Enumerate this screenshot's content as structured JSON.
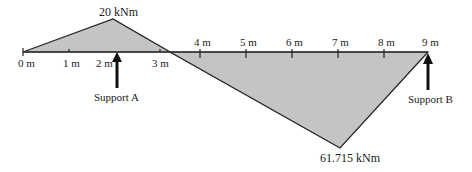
{
  "diagram": {
    "type": "bending_moment_diagram",
    "colors": {
      "fill": "#c4c4c4",
      "stroke": "#222222",
      "beam": "#333333",
      "arrow": "#111111"
    },
    "beam_ticks": [
      {
        "label": "0 m",
        "x": 23,
        "side": "below"
      },
      {
        "label": "1 m",
        "x": 69,
        "side": "below"
      },
      {
        "label": "2 m",
        "x": 101,
        "side": "below"
      },
      {
        "label": "3 m",
        "x": 160,
        "side": "below"
      },
      {
        "label": "4 m",
        "x": 200,
        "side": "above"
      },
      {
        "label": "5 m",
        "x": 246,
        "side": "above"
      },
      {
        "label": "6 m",
        "x": 292,
        "side": "above"
      },
      {
        "label": "7 m",
        "x": 338,
        "side": "above"
      },
      {
        "label": "8 m",
        "x": 384,
        "side": "above"
      },
      {
        "label": "9 m",
        "x": 428,
        "side": "above"
      }
    ],
    "peak_positive": {
      "label": "20 kNm"
    },
    "peak_negative": {
      "label": "61.715 kNm"
    },
    "supports": [
      {
        "label": "Support A"
      },
      {
        "label": "Support B"
      }
    ]
  }
}
